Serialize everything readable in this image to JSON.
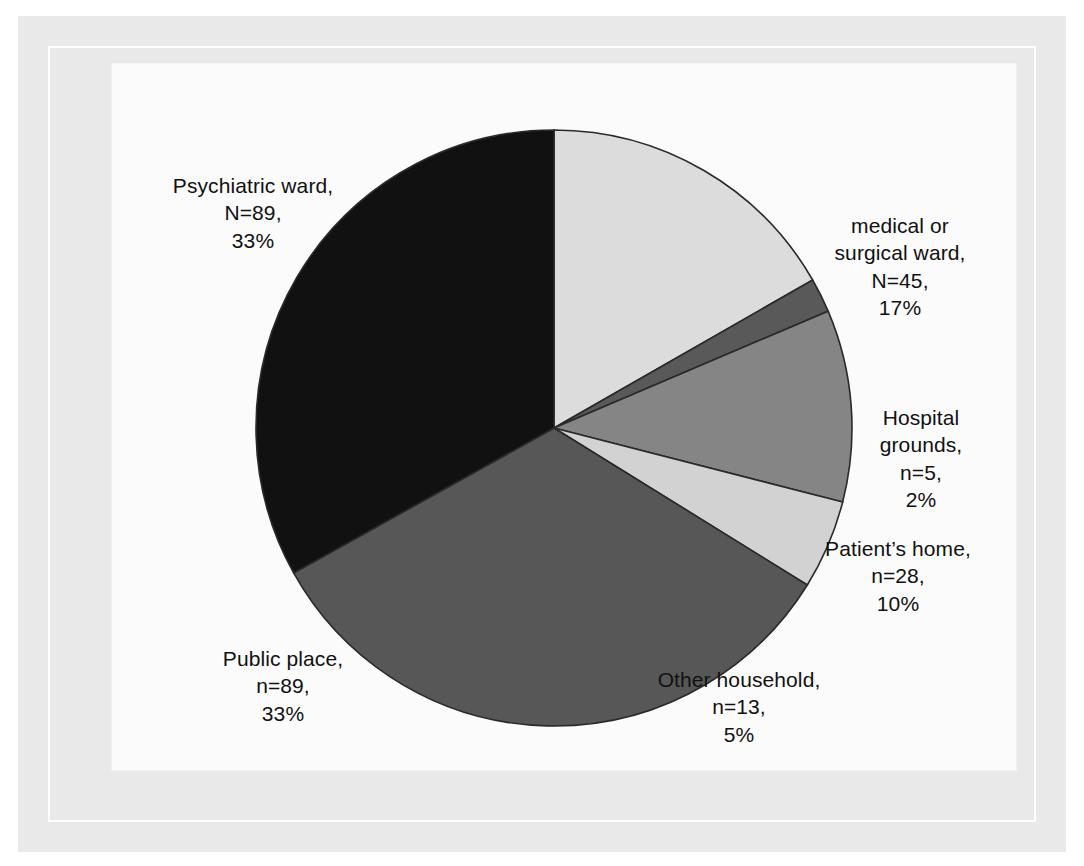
{
  "figure": {
    "kind": "pie-chart-figure",
    "background": "#ffffff",
    "frame_color": "#e9e9e9",
    "plate_color": "#fbfbfb"
  },
  "chart_data": {
    "type": "pie",
    "title": "",
    "subtitle": "",
    "xlabel": "",
    "ylabel": "",
    "grid": false,
    "legend_position": "none",
    "label_style": "outside-callout-text",
    "total_n": 269,
    "start_angle_deg": -90,
    "direction": "clockwise",
    "categories": [
      "medical or surgical ward",
      "Hospital grounds",
      "Patient's home",
      "Other household",
      "Public place",
      "Psychiatric ward"
    ],
    "values": [
      45,
      5,
      28,
      13,
      89,
      89
    ],
    "percents": [
      17,
      2,
      10,
      5,
      33,
      33
    ],
    "colors": [
      "#dcdcdc",
      "#595959",
      "#858585",
      "#d2d2d2",
      "#575757",
      "#111111"
    ],
    "slices": [
      {
        "key": "medical-surgical-ward",
        "name": "medical or surgical ward",
        "n": 45,
        "percent": 17,
        "color": "#dcdcdc",
        "label_lines": [
          "medical or",
          "surgical ward,",
          "N=45,",
          "17%"
        ]
      },
      {
        "key": "hospital-grounds",
        "name": "Hospital grounds",
        "n": 5,
        "percent": 2,
        "color": "#595959",
        "label_lines": [
          "Hospital",
          "grounds,",
          "n=5,",
          "2%"
        ]
      },
      {
        "key": "patients-home",
        "name": "Patient's home",
        "n": 28,
        "percent": 10,
        "color": "#858585",
        "label_lines": [
          "Patient’s home,",
          "n=28,",
          "10%"
        ]
      },
      {
        "key": "other-household",
        "name": "Other household",
        "n": 13,
        "percent": 5,
        "color": "#d2d2d2",
        "label_lines": [
          "Other household,",
          "n=13,",
          "5%"
        ]
      },
      {
        "key": "public-place",
        "name": "Public place",
        "n": 89,
        "percent": 33,
        "color": "#575757",
        "label_lines": [
          "Public place,",
          "n=89,",
          "33%"
        ]
      },
      {
        "key": "psychiatric-ward",
        "name": "Psychiatric ward",
        "n": 89,
        "percent": 33,
        "color": "#111111",
        "label_lines": [
          "Psychiatric ward,",
          "N=89,",
          "33%"
        ]
      }
    ]
  },
  "labels": {
    "psychiatric_ward": {
      "l1": "Psychiatric ward,",
      "l2": "N=89,",
      "l3": "33%"
    },
    "medical_surgical": {
      "l1": "medical or",
      "l2": "surgical ward,",
      "l3": "N=45,",
      "l4": "17%"
    },
    "hospital_grounds": {
      "l1": "Hospital",
      "l2": "grounds,",
      "l3": "n=5,",
      "l4": "2%"
    },
    "patients_home": {
      "l1": "Patient’s home,",
      "l2": "n=28,",
      "l3": "10%"
    },
    "other_household": {
      "l1": "Other household,",
      "l2": "n=13,",
      "l3": "5%"
    },
    "public_place": {
      "l1": "Public place,",
      "l2": "n=89,",
      "l3": "33%"
    }
  }
}
